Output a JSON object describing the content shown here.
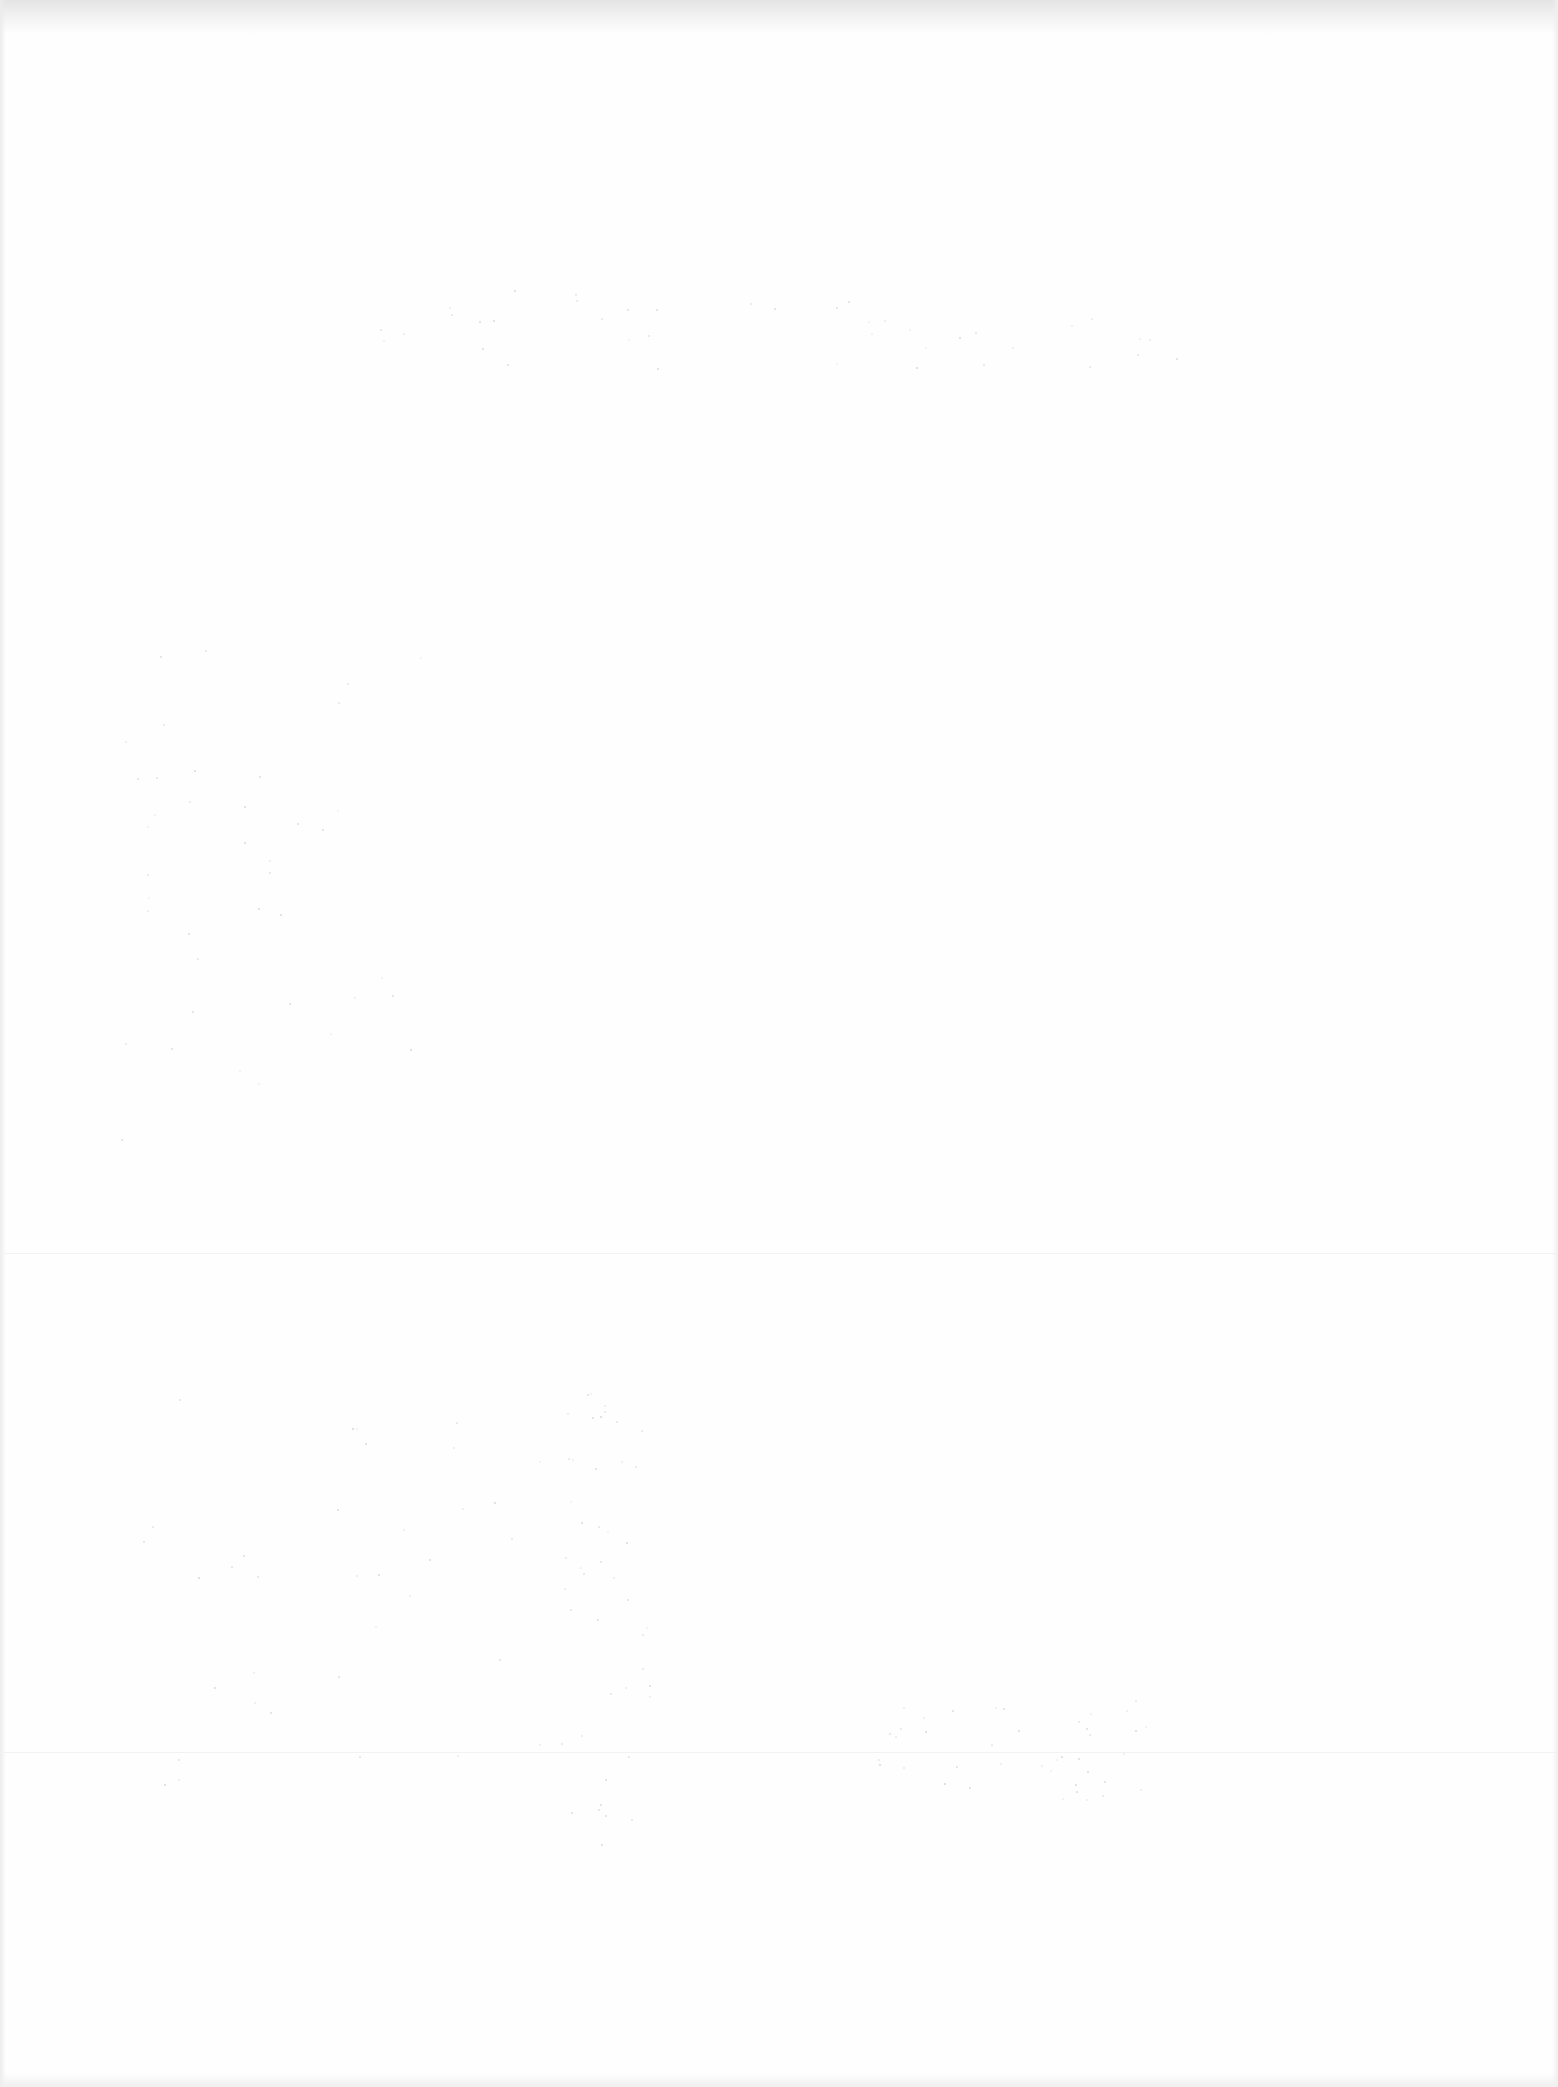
{
  "document": {
    "type": "blank scanned page",
    "title": "",
    "body_text": ""
  }
}
